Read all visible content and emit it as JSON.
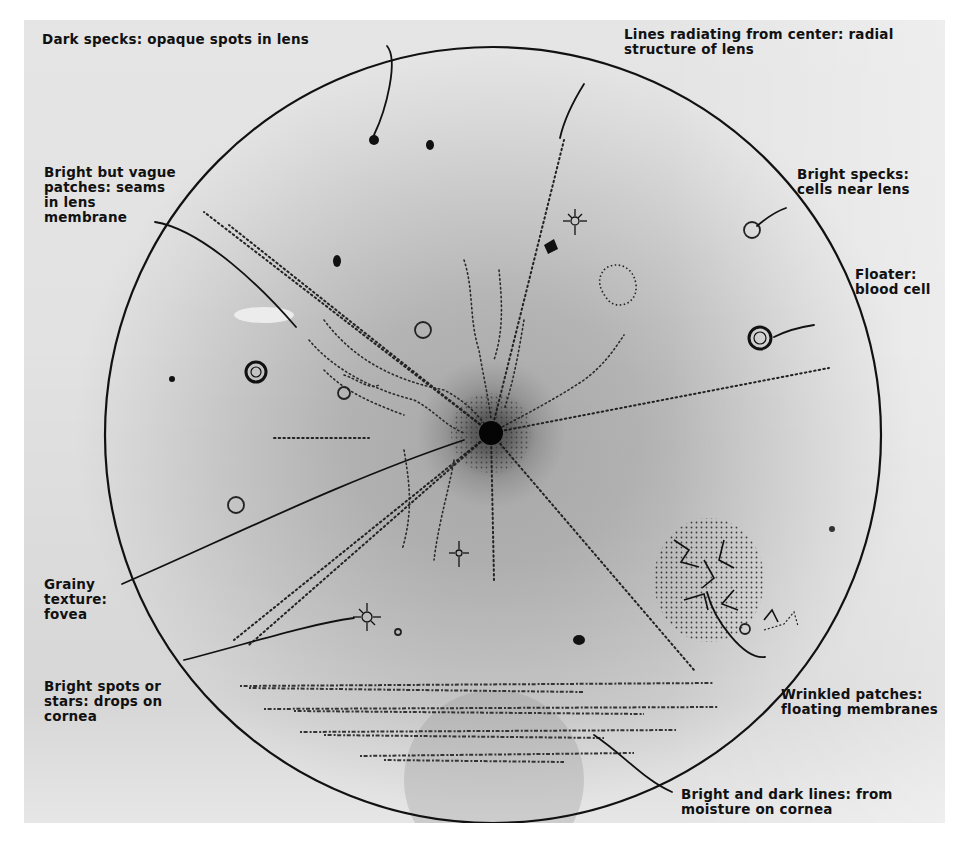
{
  "figure": {
    "background_color": "#b8b8b8",
    "line_color": "#111111",
    "labels": [
      {
        "id": "dark-specks",
        "text": "Dark specks: opaque spots in lens"
      },
      {
        "id": "radial-lines",
        "text": "Lines radiating from center: radial\nstructure of lens"
      },
      {
        "id": "bright-vague-patches",
        "text": "Bright but vague\npatches: seams\nin lens\nmembrane"
      },
      {
        "id": "bright-specks",
        "text": "Bright specks:\ncells near lens"
      },
      {
        "id": "floater",
        "text": "Floater:\nblood cell"
      },
      {
        "id": "grainy-texture",
        "text": "Grainy\ntexture:\nfovea"
      },
      {
        "id": "bright-spots-stars",
        "text": "Bright spots or\nstars: drops on\ncornea"
      },
      {
        "id": "wrinkled-patches",
        "text": "Wrinkled patches:\nfloating membranes"
      },
      {
        "id": "bright-dark-lines",
        "text": "Bright and dark lines: from\nmoisture on cornea"
      }
    ],
    "features": {
      "field_circle": {
        "cx": 469,
        "cy": 415,
        "r": 388
      },
      "fovea_center": {
        "x": 467,
        "y": 413
      },
      "dark_specks": 6,
      "bright_specks": 4,
      "blood_cell_floaters": 2,
      "stars": 3,
      "moisture_lines": 4
    }
  }
}
